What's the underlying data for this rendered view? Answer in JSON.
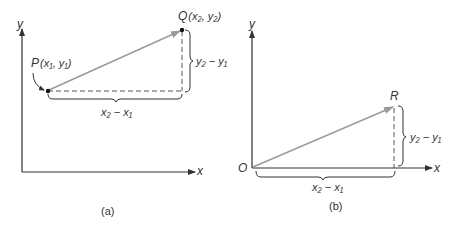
{
  "figure": {
    "panels": [
      {
        "id": "a",
        "caption": "(a)",
        "axes": {
          "x_label": "x",
          "y_label": "y"
        },
        "points": {
          "P": {
            "name": "P",
            "coords": "(x₁, y₁)"
          },
          "Q": {
            "name": "Q",
            "coords": "(x₂, y₂)"
          }
        },
        "dx_label": "x₂ − x₁",
        "dy_label": "y₂ − y₁"
      },
      {
        "id": "b",
        "caption": "(b)",
        "axes": {
          "x_label": "x",
          "y_label": "y",
          "origin_label": "O"
        },
        "points": {
          "R": {
            "name": "R"
          }
        },
        "dx_label": "x₂ − x₁",
        "dy_label": "y₂ − y₁"
      }
    ],
    "colors": {
      "axis": "#333333",
      "vector": "#999999",
      "dashed": "#555555",
      "text": "#333333"
    }
  }
}
